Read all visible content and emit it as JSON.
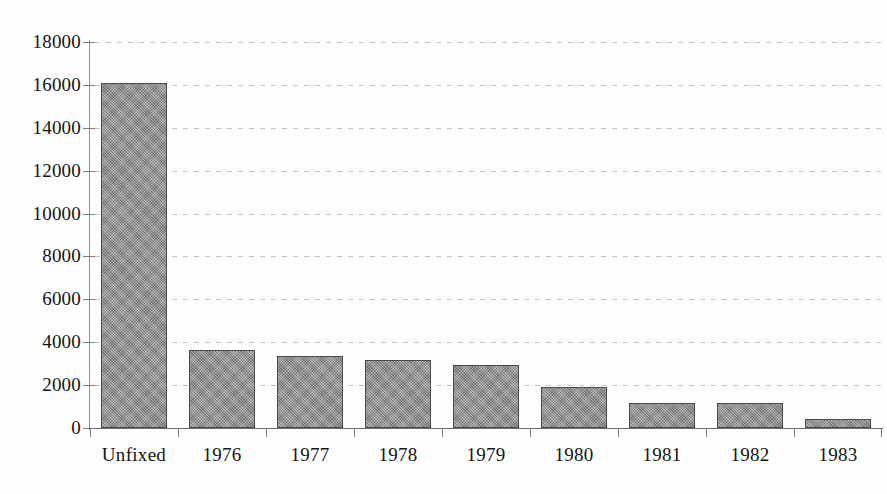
{
  "chart_data": {
    "type": "bar",
    "title": "",
    "subtitle": "",
    "xlabel": "",
    "ylabel": "",
    "categories": [
      "Unfixed",
      "1976",
      "1977",
      "1978",
      "1979",
      "1980",
      "1981",
      "1982",
      "1983"
    ],
    "values": [
      16100,
      3650,
      3350,
      3150,
      2950,
      1900,
      1150,
      1150,
      400
    ],
    "series": [
      {
        "name": "",
        "values": [
          16100,
          3650,
          3350,
          3150,
          2950,
          1900,
          1150,
          1150,
          400
        ]
      }
    ],
    "ylim": [
      0,
      18000
    ],
    "ytick_values": [
      0,
      2000,
      4000,
      6000,
      8000,
      10000,
      12000,
      14000,
      16000,
      18000
    ],
    "ytick_labels": [
      "0",
      "2000",
      "4000",
      "6000",
      "8000",
      "10000",
      "12000",
      "14000",
      "16000",
      "18000"
    ],
    "xtick_labels": [
      "Unfixed",
      "1976",
      "1977",
      "1978",
      "1979",
      "1980",
      "1981",
      "1982",
      "1983"
    ],
    "grid": true,
    "grid_axis": "y",
    "grid_style": "dotted",
    "legend": false,
    "legend_position": "none",
    "annotations": [],
    "bar_color": "#8e8e8e",
    "bar_border_color": "#4a4a4a",
    "grid_color": "#969696",
    "axis_color": "#7d7d7d",
    "text_color": "#141414",
    "background_color": "#ffffff"
  }
}
